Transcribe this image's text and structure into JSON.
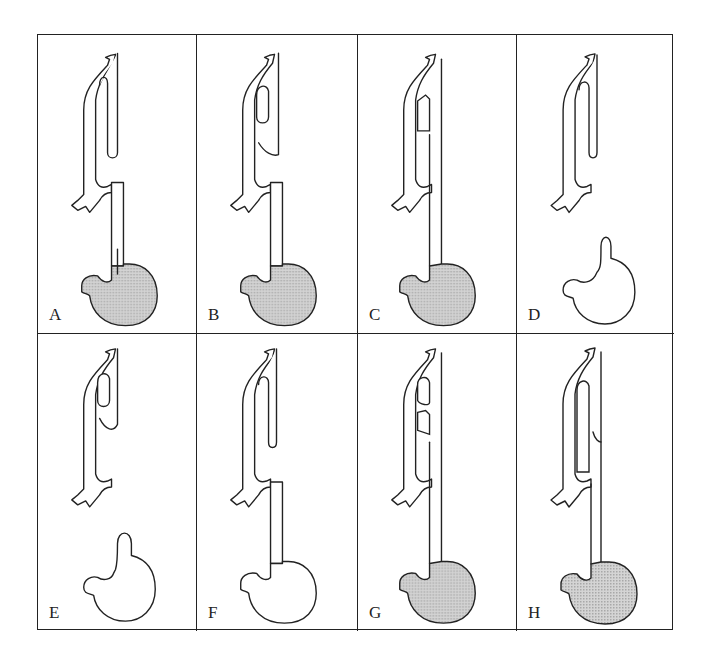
{
  "figure": {
    "colors": {
      "line": "#222222",
      "stomach_fill": "#c8c8c8",
      "background": "#ffffff"
    },
    "panels": [
      {
        "label": "A",
        "stomach_filled": true,
        "upper_pouch": "blind",
        "fistula": "distal",
        "lower_esophagus_connected": true
      },
      {
        "label": "B",
        "stomach_filled": true,
        "upper_pouch": "proximal-fistula",
        "fistula": "proximal-and-distal",
        "lower_esophagus_connected": true
      },
      {
        "label": "C",
        "stomach_filled": true,
        "upper_pouch": "H-type-fistula",
        "fistula": "H-type",
        "lower_esophagus_connected": true
      },
      {
        "label": "D",
        "stomach_filled": false,
        "upper_pouch": "blind",
        "fistula": "none",
        "lower_esophagus_connected": false
      },
      {
        "label": "E",
        "stomach_filled": false,
        "upper_pouch": "proximal-fistula",
        "fistula": "proximal",
        "lower_esophagus_connected": false
      },
      {
        "label": "F",
        "stomach_filled": false,
        "upper_pouch": "blind",
        "fistula": "distal",
        "lower_esophagus_connected": true
      },
      {
        "label": "G",
        "stomach_filled": true,
        "upper_pouch": "multiple-H-fistulae",
        "fistula": "multiple",
        "lower_esophagus_connected": true
      },
      {
        "label": "H",
        "stomach_filled": true,
        "upper_pouch": "long-fistula-with-stenosis",
        "fistula": "long",
        "lower_esophagus_connected": true
      }
    ]
  }
}
